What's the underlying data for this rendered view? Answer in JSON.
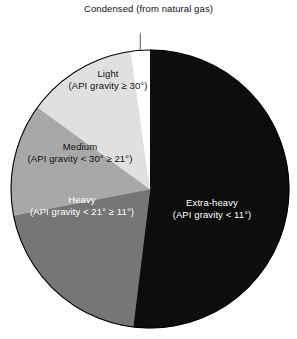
{
  "chart_data": {
    "type": "pie",
    "title": "",
    "legend_position": "callout-labels",
    "categories": [
      "Extra-heavy",
      "Heavy",
      "Medium",
      "Light",
      "Condensed"
    ],
    "values": [
      52,
      20,
      14,
      10,
      4
    ],
    "units": "percent of total",
    "slices": [
      {
        "name": "Extra-heavy",
        "label_line1": "Extra-heavy",
        "label_line2": "(API gravity < 11°)",
        "value": 52,
        "color": "#0d0d0d",
        "text_color": "#ffffff",
        "start_angle_deg": 0,
        "end_angle_deg": 187,
        "label_x": 212,
        "label_y": 208
      },
      {
        "name": "Heavy",
        "label_line1": "Heavy",
        "label_line2": "(API gravity < 21° ≥ 11°)",
        "value": 20,
        "color": "#767676",
        "text_color": "#ffffff",
        "start_angle_deg": 187,
        "end_angle_deg": 259,
        "label_x": 82,
        "label_y": 205
      },
      {
        "name": "Medium",
        "label_line1": "Medium",
        "label_line2": "(API gravity < 30° ≥ 21°)",
        "value": 14,
        "color": "#a8a8a8",
        "text_color": "#111111",
        "start_angle_deg": 259,
        "end_angle_deg": 306,
        "label_x": 80,
        "label_y": 152
      },
      {
        "name": "Light",
        "label_line1": "Light",
        "label_line2": "(API gravity ≥ 30°)",
        "value": 10,
        "color": "#e0e0e0",
        "text_color": "#111111",
        "start_angle_deg": 306,
        "end_angle_deg": 352,
        "label_x": 108,
        "label_y": 79
      },
      {
        "name": "Condensed",
        "label_line1": "Condensed",
        "label_line2": "(from natural gas)",
        "value": 4,
        "color": "#ffffff",
        "text_color": "#111111",
        "start_angle_deg": 352,
        "end_angle_deg": 360,
        "label_x": 148,
        "label_y": 16
      }
    ],
    "geometry": {
      "center_x": 150,
      "center_y": 189,
      "radius": 139,
      "outline_color": "#000000"
    }
  },
  "callout": {
    "condensed_line1": "Condensed",
    "condensed_line2": "(from natural gas)"
  }
}
